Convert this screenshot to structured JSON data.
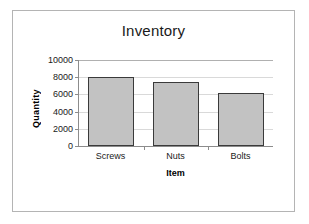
{
  "chart_data": {
    "type": "bar",
    "title": "Inventory",
    "xlabel": "Item",
    "ylabel": "Quantity",
    "categories": [
      "Screws",
      "Nuts",
      "Bolts"
    ],
    "values": [
      8000,
      7500,
      6200
    ],
    "ylim": [
      0,
      10000
    ],
    "yticks": [
      0,
      2000,
      4000,
      6000,
      8000,
      10000
    ],
    "ytick_labels": [
      "0",
      "2000",
      "4000",
      "6000",
      "8000",
      "10000"
    ],
    "grid": true,
    "legend": false,
    "legend_position": "none",
    "bar_color": "#c2c2c2",
    "bar_border_color": "#3a3a3a",
    "plot_background": "#ffffff",
    "gridline_color": "#d9d9d9",
    "axis_color": "#8c8c8c",
    "frame_color": "#b4b4b4",
    "text_color": "#1a1a1a"
  }
}
